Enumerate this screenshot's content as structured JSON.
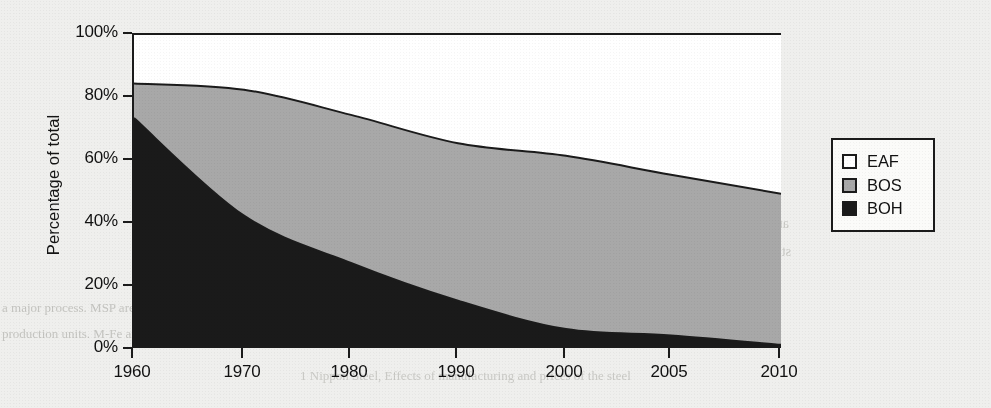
{
  "chart_data": {
    "type": "area",
    "stacked": true,
    "title": "",
    "xlabel": "",
    "ylabel": "Percentage of total",
    "x": [
      1960,
      1970,
      1980,
      1990,
      2000,
      2005,
      2010
    ],
    "xtick_labels": [
      "1960",
      "1970",
      "1980",
      "1990",
      "2000",
      "2005",
      "2010"
    ],
    "ytick_labels": [
      "0%",
      "20%",
      "40%",
      "60%",
      "80%",
      "100%"
    ],
    "ytick_values": [
      0,
      20,
      40,
      60,
      80,
      100
    ],
    "ylim": [
      0,
      100
    ],
    "grid": false,
    "legend_position": "right",
    "series": [
      {
        "name": "EAF",
        "color": "#ffffff",
        "values": [
          16,
          18,
          26,
          35,
          39,
          45,
          51
        ]
      },
      {
        "name": "BOS",
        "color": "#a8a8a8",
        "values": [
          11,
          40,
          47,
          50,
          55,
          51,
          48
        ]
      },
      {
        "name": "BOH",
        "color": "#1a1a1a",
        "values": [
          73,
          42,
          27,
          15,
          6,
          4,
          1
        ]
      }
    ],
    "cumulative_top_of_bos": [
      84,
      82,
      74,
      65,
      61,
      55,
      49
    ],
    "cumulative_top_of_boh": [
      73,
      42,
      27,
      15,
      6,
      4,
      1
    ]
  },
  "legend": {
    "items": [
      {
        "label": "EAF",
        "color": "#ffffff"
      },
      {
        "label": "BOS",
        "color": "#a8a8a8"
      },
      {
        "label": "BOH",
        "color": "#1a1a1a"
      }
    ]
  },
  "background_text": {
    "heading": "PRESENT STATUS OF THE WORLD STEEL INDUSTRY",
    "subheading": "1 Classification",
    "lines": [
      "Steel making processes can be",
      "We define one steel route from",
      "are relatively large, and this is the",
      "steel per ton of iron ore. Meltshop",
      "furnace type, with",
      "a major process. MSP are EAF, but not so much of energy, the entire",
      "production units. M-Fe are smaller in scale with a higher operating, and the heat"
    ],
    "footer": "1 Nippon Steel, Effects of manufacturing and prices of the steel"
  }
}
